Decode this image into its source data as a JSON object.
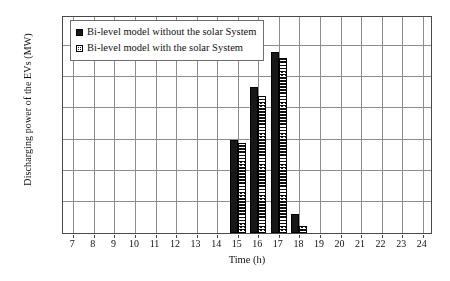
{
  "chart_data": {
    "type": "bar",
    "title": "",
    "xlabel": "Time (h)",
    "ylabel": "Discharging power of the EVs (MW)",
    "categories": [
      7,
      8,
      9,
      10,
      11,
      12,
      13,
      14,
      15,
      16,
      17,
      18,
      19,
      20,
      21,
      22,
      23,
      24
    ],
    "xtick_labels": [
      "7",
      "8",
      "9",
      "10",
      "11",
      "12",
      "13",
      "14",
      "15",
      "16",
      "17",
      "18",
      "19",
      "20",
      "21",
      "22",
      "23",
      "24"
    ],
    "xlim": [
      6.5,
      24.5
    ],
    "ylim": [
      0,
      3.5
    ],
    "ytick_labels": [
      "0",
      "0.5",
      "1",
      "1.5",
      "2",
      "2.5",
      "3",
      "3.5"
    ],
    "ytick_values": [
      0,
      0.5,
      1,
      1.5,
      2,
      2.5,
      3,
      3.5
    ],
    "grid": true,
    "legend_position": "upper-left-inside",
    "series": [
      {
        "name": "Bi-level model without the solar System",
        "pattern": "solid-black",
        "color": "#171717",
        "values": [
          0,
          0,
          0,
          0,
          0,
          0,
          0,
          0,
          1.49,
          2.34,
          2.9,
          0.3,
          0,
          0,
          0,
          0,
          0,
          0
        ]
      },
      {
        "name": "Bi-level model with the solar System",
        "pattern": "checkered",
        "color": "#171717",
        "values": [
          0,
          0,
          0,
          0,
          0,
          0,
          0,
          0,
          1.45,
          2.2,
          2.81,
          0.12,
          0,
          0,
          0,
          0,
          0,
          0
        ]
      }
    ]
  },
  "legend": {
    "items": [
      {
        "label": "Bi-level model without the solar System"
      },
      {
        "label": "Bi-level model with the solar System"
      }
    ]
  }
}
